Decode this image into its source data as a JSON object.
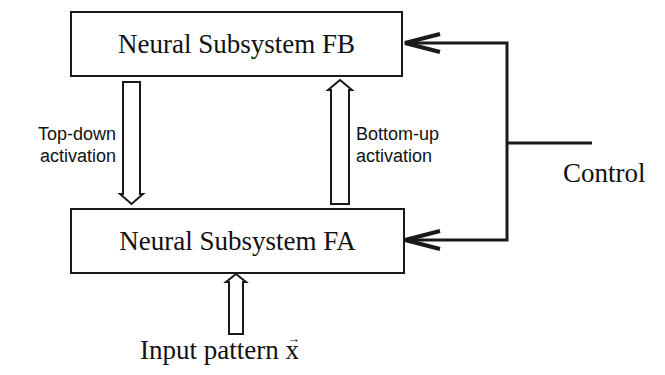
{
  "diagram": {
    "boxes": {
      "fb": {
        "label": "Neural Subsystem FB"
      },
      "fa": {
        "label": "Neural Subsystem FA"
      }
    },
    "arrows": {
      "top_down": {
        "line1": "Top-down",
        "line2": "activation"
      },
      "bottom_up": {
        "line1": "Bottom-up",
        "line2": "activation"
      }
    },
    "control": {
      "label": "Control"
    },
    "input": {
      "label": "Input pattern x",
      "vector_symbol": "→"
    }
  }
}
